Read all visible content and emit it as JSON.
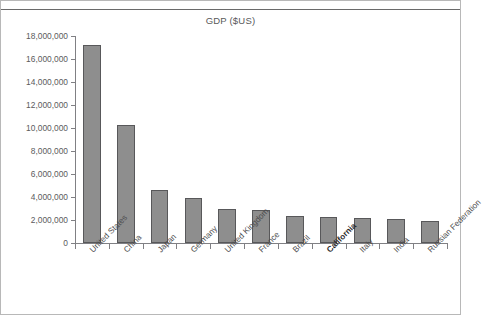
{
  "chart_data": {
    "type": "bar",
    "title": "GDP ($US)",
    "xlabel": "",
    "ylabel": "",
    "ylim": [
      0,
      18000000
    ],
    "grid": false,
    "legend": null,
    "categories": [
      "United States",
      "China",
      "Japan",
      "Germany",
      "United Kingdom",
      "France",
      "Brazil",
      "California",
      "Italy",
      "India",
      "Russian Federation"
    ],
    "values": [
      17200000,
      10300000,
      4600000,
      3900000,
      3000000,
      2850000,
      2350000,
      2300000,
      2150000,
      2050000,
      1900000
    ],
    "highlighted_categories": [
      "California"
    ],
    "ytick_labels": [
      "18,000,000",
      "16,000,000",
      "14,000,000",
      "12,000,000",
      "10,000,000",
      "8,000,000",
      "6,000,000",
      "4,000,000",
      "2,000,000",
      "0"
    ],
    "ytick_values": [
      18000000,
      16000000,
      14000000,
      12000000,
      10000000,
      8000000,
      6000000,
      4000000,
      2000000,
      0
    ],
    "bar_color": "#8e8e8e",
    "bar_border_color": "#58585a",
    "axis_color": "#808084",
    "text_color": "#58585a"
  }
}
